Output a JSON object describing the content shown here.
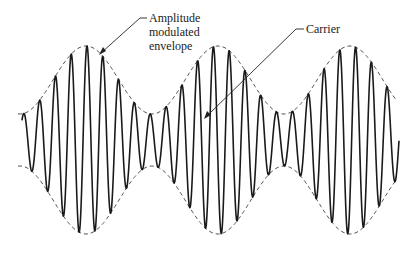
{
  "diagram": {
    "labels": {
      "envelope": [
        "Amplitude",
        "modulated",
        "envelope"
      ],
      "carrier": "Carrier"
    },
    "colors": {
      "carrier": "#1a1a1a",
      "envelope": "#555555",
      "text": "#222222",
      "background": "#ffffff"
    }
  },
  "chart_data": {
    "type": "line",
    "title": "",
    "series": [
      {
        "name": "Carrier",
        "style": "solid",
        "description": "High-frequency sinusoid whose amplitude follows the envelope"
      },
      {
        "name": "Amplitude modulated envelope",
        "style": "dashed",
        "description": "Low-frequency sinusoidal envelope (upper and lower)"
      }
    ],
    "params": {
      "center_y": 140,
      "x_start": 22,
      "x_end": 399,
      "envelope_x_start": 18,
      "envelope_x_end": 396,
      "carrier_period_px": 15.8,
      "carrier_phase_x": 87,
      "envelope_period_px": 132,
      "envelope_peak_x": 86,
      "amp_mean": 60,
      "amp_dev": 34
    },
    "envelope_maxima_x": [
      86,
      218,
      350
    ],
    "envelope_minima_x": [
      152,
      284
    ],
    "grid": false,
    "axes": false
  }
}
